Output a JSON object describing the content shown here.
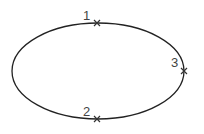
{
  "diagram": {
    "shape": "ellipse",
    "stroke_color": "#222222",
    "points": [
      {
        "label": "1",
        "x": 97,
        "y": 23
      },
      {
        "label": "2",
        "x": 97,
        "y": 119
      },
      {
        "label": "3",
        "x": 184,
        "y": 71
      }
    ]
  }
}
